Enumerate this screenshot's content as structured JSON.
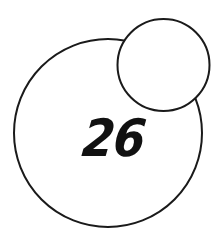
{
  "diagram": {
    "background": "#ffffff",
    "stroke_color": "#1a1a1a",
    "stroke_width": 2,
    "large_circle": {
      "cx": 108,
      "cy": 133,
      "r": 94,
      "fill": "#ffffff"
    },
    "small_circle": {
      "cx": 163.5,
      "cy": 65,
      "r": 46,
      "fill": "#ffffff"
    },
    "label": "26",
    "label_color": "#111111"
  }
}
